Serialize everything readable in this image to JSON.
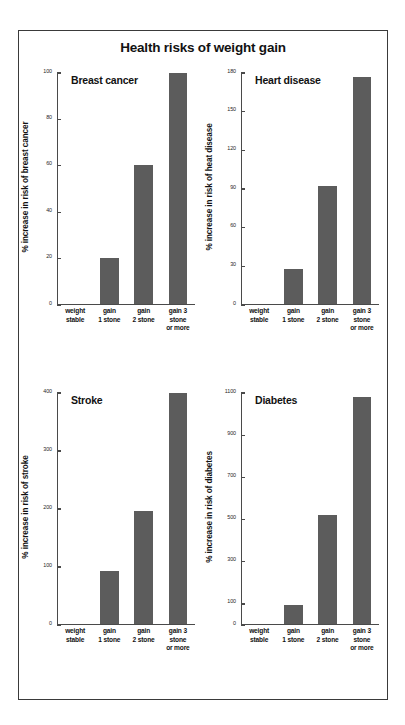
{
  "figure": {
    "title": "Health risks of weight gain",
    "border_color": "#3a3a3a",
    "bar_color": "#5c5c5c",
    "background": "#ffffff"
  },
  "categories": [
    "weight\nstable",
    "gain\n1 stone",
    "gain\n2 stone",
    "gain 3 stone\nor more"
  ],
  "chart_data": [
    {
      "type": "bar",
      "title": "Breast cancer",
      "xlabel": "",
      "ylabel": "% increase in risk of breast cancer",
      "categories": [
        "weight stable",
        "gain 1 stone",
        "gain 2 stone",
        "gain 3 stone or more"
      ],
      "values": [
        0,
        20,
        60,
        100
      ],
      "ylim": [
        0,
        100
      ],
      "yticks": [
        0,
        20,
        40,
        60,
        80,
        100
      ],
      "ytick_labels": [
        "0",
        "20",
        "40",
        "60",
        "80",
        "100"
      ],
      "grid": false,
      "legend": "none"
    },
    {
      "type": "bar",
      "title": "Heart disease",
      "xlabel": "",
      "ylabel": "% increase in risk of heat disease",
      "categories": [
        "weight stable",
        "gain 1 stone",
        "gain 2 stone",
        "gain 3 stone or more"
      ],
      "values": [
        0,
        27,
        92,
        177
      ],
      "ylim": [
        0,
        180
      ],
      "yticks": [
        0,
        30,
        60,
        90,
        120,
        150,
        180
      ],
      "ytick_labels": [
        "0",
        "30",
        "60",
        "90",
        "120",
        "150",
        "180"
      ],
      "grid": false,
      "legend": "none"
    },
    {
      "type": "bar",
      "title": "Stroke",
      "xlabel": "",
      "ylabel": "% increase in risk of stroke",
      "categories": [
        "weight stable",
        "gain 1 stone",
        "gain 2 stone",
        "gain 3 stone or more"
      ],
      "values": [
        0,
        92,
        195,
        400
      ],
      "ylim": [
        0,
        400
      ],
      "yticks": [
        0,
        100,
        200,
        300,
        400
      ],
      "ytick_labels": [
        "0",
        "100",
        "200",
        "300",
        "400"
      ],
      "grid": false,
      "legend": "none"
    },
    {
      "type": "bar",
      "title": "Diabetes",
      "xlabel": "",
      "ylabel": "% increase in risk of diabetes",
      "categories": [
        "weight stable",
        "gain 1 stone",
        "gain 2 stone",
        "gain 3 stone or more"
      ],
      "values": [
        0,
        90,
        520,
        1080
      ],
      "ylim": [
        0,
        1100
      ],
      "yticks": [
        0,
        100,
        300,
        500,
        700,
        900,
        1100
      ],
      "ytick_labels": [
        "0",
        "100",
        "300",
        "500",
        "700",
        "900",
        "1100"
      ],
      "grid": false,
      "legend": "none"
    }
  ]
}
